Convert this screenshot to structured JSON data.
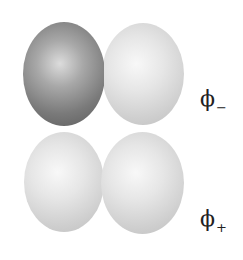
{
  "diagram": {
    "orbitals": [
      {
        "id": "phi_minus",
        "label_symbol": "ϕ",
        "label_subscript": "−",
        "left_lobe": "dark",
        "right_lobe": "light"
      },
      {
        "id": "phi_plus",
        "label_symbol": "ϕ",
        "label_subscript": "+",
        "left_lobe": "light",
        "right_lobe": "light"
      }
    ],
    "colors": {
      "dark_lobe": "#7a7a7a",
      "light_lobe": "#e2e2e2",
      "background": "#ffffff",
      "label": "#222222"
    }
  }
}
